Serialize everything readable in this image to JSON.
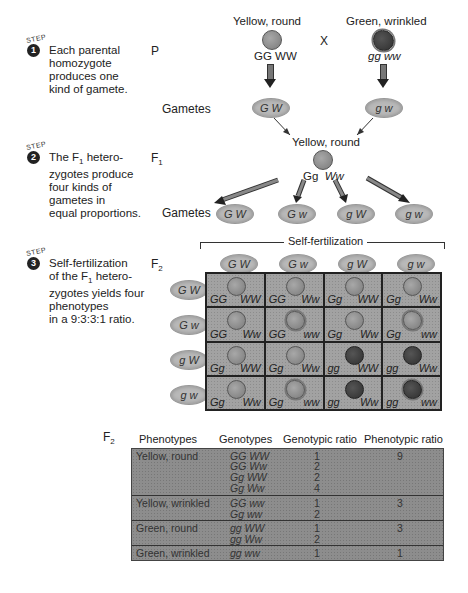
{
  "steps": [
    {
      "label": "STEP",
      "number": "1",
      "text": "Each parental\nhomozygote\nproduces one\nkind of gamete."
    },
    {
      "label": "STEP",
      "number": "2",
      "text_pre": "The F",
      "text_sub": "1",
      "text_post": " hetero-\nzygotes produce\nfour kinds of\ngametes in\nequal proportions."
    },
    {
      "label": "STEP",
      "number": "3",
      "text_line1": "Self-fertilization",
      "text_pre": "of the F",
      "text_sub": "1",
      "text_post": " hetero-",
      "text_rest": "zygotes yields four\nphenotypes\nin a 9:3:3:1 ratio."
    }
  ],
  "generations": {
    "p": "P",
    "f1_base": "F",
    "f1_sub": "1",
    "f2_base": "F",
    "f2_sub": "2",
    "gametes_label": "Gametes"
  },
  "parents": {
    "left": {
      "phenotype": "Yellow, round",
      "genotype": "GG WW",
      "gamete": "G W"
    },
    "cross": "X",
    "right": {
      "phenotype": "Green, wrinkled",
      "genotype": "gg ww",
      "gamete": "g w"
    }
  },
  "f1": {
    "phenotype": "Yellow, round",
    "genotype_a": "Gg",
    "genotype_b": "Ww",
    "gametes": [
      "G W",
      "G w",
      "g W",
      "g w"
    ]
  },
  "punnett": {
    "title": "Self-fertilization",
    "col_gametes": [
      "G W",
      "G w",
      "g W",
      "g w"
    ],
    "row_gametes": [
      "G W",
      "G w",
      "g W",
      "g w"
    ],
    "cells": [
      [
        {
          "g1": "GG",
          "g2": "WW",
          "seed": "yellow-round"
        },
        {
          "g1": "GG",
          "g2": "Ww",
          "seed": "yellow-round"
        },
        {
          "g1": "Gg",
          "g2": "WW",
          "seed": "yellow-round"
        },
        {
          "g1": "Gg",
          "g2": "Ww",
          "seed": "yellow-round"
        }
      ],
      [
        {
          "g1": "GG",
          "g2": "Ww",
          "seed": "yellow-round"
        },
        {
          "g1": "GG",
          "g2": "ww",
          "seed": "yellow-wrinkled"
        },
        {
          "g1": "Gg",
          "g2": "Ww",
          "seed": "yellow-round"
        },
        {
          "g1": "Gg",
          "g2": "ww",
          "seed": "yellow-wrinkled"
        }
      ],
      [
        {
          "g1": "Gg",
          "g2": "WW",
          "seed": "yellow-round"
        },
        {
          "g1": "Gg",
          "g2": "Ww",
          "seed": "yellow-round"
        },
        {
          "g1": "gg",
          "g2": "WW",
          "seed": "green-round"
        },
        {
          "g1": "gg",
          "g2": "Ww",
          "seed": "green-round"
        }
      ],
      [
        {
          "g1": "Gg",
          "g2": "Ww",
          "seed": "yellow-round"
        },
        {
          "g1": "Gg",
          "g2": "ww",
          "seed": "yellow-wrinkled"
        },
        {
          "g1": "gg",
          "g2": "Ww",
          "seed": "green-round"
        },
        {
          "g1": "gg",
          "g2": "ww",
          "seed": "green-wrinkled"
        }
      ]
    ]
  },
  "summary_table": {
    "gen_base": "F",
    "gen_sub": "2",
    "headers": [
      "Phenotypes",
      "Genotypes",
      "Genotypic ratio",
      "Phenotypic ratio"
    ],
    "groups": [
      {
        "phenotype": "Yellow, round",
        "rows": [
          {
            "genotype": "GG  WW",
            "ratio": "1"
          },
          {
            "genotype": "GG  Ww",
            "ratio": "2"
          },
          {
            "genotype": "Gg  WW",
            "ratio": "2"
          },
          {
            "genotype": "Gg  Ww",
            "ratio": "4"
          }
        ],
        "phenotypic_ratio": "9"
      },
      {
        "phenotype": "Yellow, wrinkled",
        "rows": [
          {
            "genotype": "GG  ww",
            "ratio": "1"
          },
          {
            "genotype": "Gg  ww",
            "ratio": "2"
          }
        ],
        "phenotypic_ratio": "3"
      },
      {
        "phenotype": "Green, round",
        "rows": [
          {
            "genotype": "gg  WW",
            "ratio": "1"
          },
          {
            "genotype": "gg  Ww",
            "ratio": "2"
          }
        ],
        "phenotypic_ratio": "3"
      },
      {
        "phenotype": "Green, wrinkled",
        "rows": [
          {
            "genotype": "gg  ww",
            "ratio": "1"
          }
        ],
        "phenotypic_ratio": "1"
      }
    ]
  }
}
